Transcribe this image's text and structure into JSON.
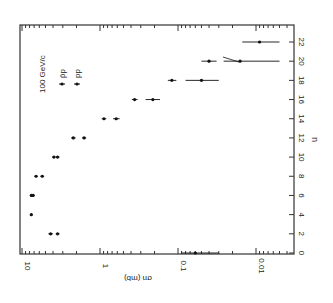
{
  "chart_data": {
    "type": "scatter",
    "orientation": "rotated 90 degrees (x axis vertical on right, y axis horizontal at bottom)",
    "title": "",
    "annotation": "100 GeV/c",
    "xlabel": "n",
    "ylabel": "σn (mb)",
    "xlim": [
      0,
      23
    ],
    "ylim": [
      0.004,
      10
    ],
    "yscale": "log",
    "x_ticks": [
      "0",
      "2",
      "4",
      "6",
      "8",
      "10",
      "12",
      "14",
      "16",
      "18",
      "20",
      "22"
    ],
    "y_ticks": [
      "10",
      "1",
      "0.1",
      "0.01"
    ],
    "legend": [
      "p̄p",
      "pp"
    ],
    "grid": false,
    "series": [
      {
        "name": "p̄p",
        "x": [
          2,
          4,
          6,
          8,
          10,
          12,
          14,
          16,
          18,
          20,
          22
        ],
        "y": [
          4.3,
          7.6,
          7.6,
          6.6,
          3.9,
          2.2,
          0.89,
          0.36,
          0.12,
          0.04,
          0.009
        ],
        "err_low": [
          0.3,
          0.3,
          0.3,
          0.3,
          0.2,
          0.15,
          0.06,
          0.03,
          0.015,
          0.008,
          0.004
        ],
        "err_high": [
          0.3,
          0.3,
          0.3,
          0.3,
          0.2,
          0.15,
          0.06,
          0.03,
          0.015,
          0.01,
          0.006
        ]
      },
      {
        "name": "pp",
        "x": [
          0,
          2,
          6,
          8,
          10,
          12,
          14,
          16,
          18,
          20
        ],
        "y": [
          0.06,
          3.5,
          7.2,
          5.5,
          3.5,
          1.6,
          0.62,
          0.21,
          0.05,
          0.016
        ],
        "err_low": [
          0.03,
          0.2,
          0.3,
          0.3,
          0.2,
          0.1,
          0.06,
          0.04,
          0.02,
          0.011
        ],
        "err_high": [
          0.03,
          0.2,
          0.3,
          0.3,
          0.2,
          0.1,
          0.06,
          0.05,
          0.03,
          0.01
        ]
      }
    ]
  },
  "labels": {
    "energy": "100 GeV/c",
    "legend_pbar": "p̄p",
    "legend_pp": "pp",
    "x_title": "n",
    "y_title": "σn (mb)"
  }
}
